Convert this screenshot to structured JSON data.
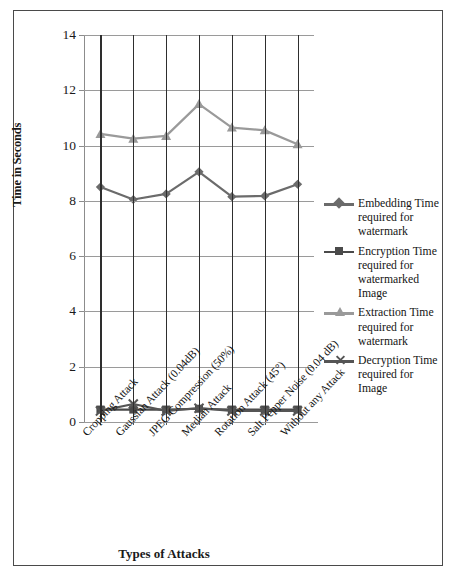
{
  "chart_data": {
    "type": "line",
    "title": "",
    "xlabel": "Types  of Attacks",
    "ylabel": "Time in Seconds",
    "ylim": [
      0,
      14
    ],
    "yticks": [
      0,
      2,
      4,
      6,
      8,
      10,
      12,
      14
    ],
    "grid": true,
    "legend_position": "right",
    "categories": [
      "Cropping Attack",
      "Gaussian Attack (0.04dB)",
      "JPEG Compression (50%)",
      "Median Attack",
      "Rotation Attack (45°)",
      "Salt Pepper Noise (0.04 dB)",
      "Without any Attack"
    ],
    "series": [
      {
        "name": "Embedding Time required for watermark",
        "marker": "diamond",
        "color": "#6b6b6b",
        "values": [
          8.5,
          8.05,
          8.25,
          9.05,
          8.15,
          8.18,
          8.6
        ]
      },
      {
        "name": "Encryption Time required for watermarked Image",
        "marker": "square",
        "color": "#4a4a4a",
        "values": [
          0.45,
          0.45,
          0.45,
          0.48,
          0.45,
          0.45,
          0.45
        ]
      },
      {
        "name": "Extraction Time required for watermark",
        "marker": "triangle",
        "color": "#9a9a9a",
        "values": [
          10.42,
          10.25,
          10.35,
          11.5,
          10.65,
          10.55,
          10.05
        ]
      },
      {
        "name": "Decryption Time required for Image",
        "marker": "cross",
        "color": "#555555",
        "values": [
          0.4,
          0.65,
          0.4,
          0.5,
          0.4,
          0.4,
          0.4
        ]
      }
    ]
  },
  "legend": {
    "items": [
      {
        "label": "Embedding Time required for watermark"
      },
      {
        "label": "Encryption Time required for watermarked Image"
      },
      {
        "label": "Extraction Time required for watermark"
      },
      {
        "label": "Decryption Time required for Image"
      }
    ]
  },
  "axes": {
    "y_title": "Time in Seconds",
    "x_title": "Types  of Attacks",
    "y_tick_labels": [
      "14",
      "12",
      "10",
      "8",
      "6",
      "4",
      "2",
      "0"
    ]
  },
  "colors": {
    "series_embedding": "#6b6b6b",
    "series_encryption": "#4a4a4a",
    "series_extraction": "#9a9a9a",
    "series_decryption": "#555555",
    "gridline": "#9a9a9a",
    "category_line": "#2e2e2e",
    "frame": "#4a4a4a"
  }
}
